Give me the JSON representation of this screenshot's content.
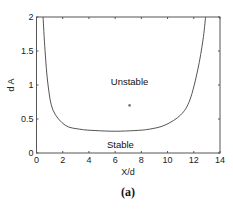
{
  "chart_data": {
    "type": "line",
    "title": "",
    "caption": "(a)",
    "xlabel": "X/d",
    "ylabel": "d A",
    "xlim": [
      0,
      14
    ],
    "ylim": [
      0,
      2
    ],
    "xticks": [
      0,
      2,
      4,
      6,
      8,
      10,
      12,
      14
    ],
    "yticks": [
      0,
      0.5,
      1,
      1.5,
      2
    ],
    "xtick_labels": [
      "0",
      "2",
      "4",
      "6",
      "8",
      "10",
      "12",
      "14"
    ],
    "ytick_labels": [
      "0",
      "0.5",
      "1",
      "1.5",
      "2"
    ],
    "grid": false,
    "legend": null,
    "series": [
      {
        "name": "stability boundary",
        "color": "#555555",
        "x": [
          0.5,
          0.65,
          0.88,
          1.26,
          2.18,
          3.3,
          4.47,
          6.0,
          7.5,
          8.6,
          9.8,
          11.0,
          11.7,
          12.3,
          12.7,
          12.9
        ],
        "y": [
          2.0,
          1.51,
          1.0,
          0.63,
          0.41,
          0.35,
          0.33,
          0.32,
          0.33,
          0.35,
          0.41,
          0.56,
          0.78,
          1.22,
          1.66,
          2.0
        ]
      }
    ],
    "points": [
      {
        "name": "operating point",
        "x": 7.1,
        "y": 0.7,
        "marker": "dot",
        "color": "#777777"
      }
    ],
    "annotations": [
      {
        "text": "Unstable",
        "x": 7.1,
        "y": 1.05
      },
      {
        "text": "Stable",
        "x": 6.4,
        "y": 0.12
      }
    ]
  }
}
